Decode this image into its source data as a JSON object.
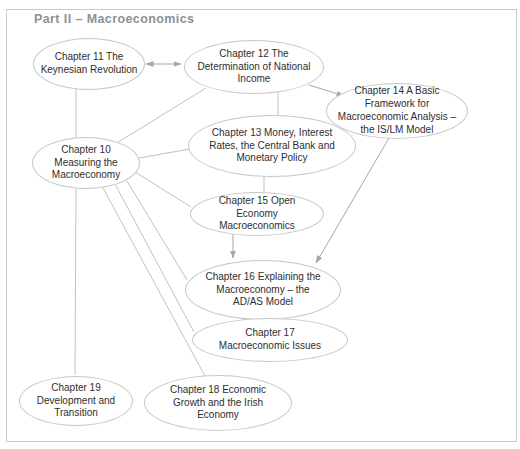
{
  "title": "Part II – Macroeconomics",
  "colors": {
    "frame": "#c9cbc9",
    "title": "#8e9193",
    "node_border": "#c5c9c6",
    "node_fill": "#ffffff",
    "text": "#2e2e2e",
    "line": "#bfc3bf",
    "arrow": "#a3a7a5"
  },
  "nodes": {
    "ch10": {
      "label": "Chapter 10 Measuring the Macroeconomy"
    },
    "ch11": {
      "label": "Chapter 11 The Keynesian Revolution"
    },
    "ch12": {
      "label": "Chapter 12 The Determination of National Income"
    },
    "ch13": {
      "label": "Chapter 13 Money, Interest Rates, the Central Bank and Monetary Policy"
    },
    "ch14": {
      "label": "Chapter 14 A Basic Framework for Macroeconomic Analysis – the IS/LM Model"
    },
    "ch15": {
      "label": "Chapter 15 Open Economy Macroeconomics"
    },
    "ch16": {
      "label": "Chapter 16 Explaining the Macroeconomy – the AD/AS Model"
    },
    "ch17": {
      "label": "Chapter 17 Macroeconomic Issues"
    },
    "ch18": {
      "label": "Chapter 18 Economic Growth and the Irish Economy"
    },
    "ch19": {
      "label": "Chapter 19 Development and Transition"
    }
  },
  "edges": [
    {
      "from": "ch11",
      "to": "ch12",
      "style": "double-arrow"
    },
    {
      "from": "ch12",
      "to": "ch14",
      "style": "arrow"
    },
    {
      "from": "ch13",
      "to": "ch14",
      "style": "arrow"
    },
    {
      "from": "ch15",
      "to": "ch16",
      "style": "arrow"
    },
    {
      "from": "ch14",
      "to": "ch16",
      "style": "arrow"
    },
    {
      "from": "ch11",
      "to": "ch10",
      "style": "line"
    },
    {
      "from": "ch12",
      "to": "ch10",
      "style": "line"
    },
    {
      "from": "ch12",
      "to": "ch13",
      "style": "line"
    },
    {
      "from": "ch13",
      "to": "ch15",
      "style": "line"
    },
    {
      "from": "ch10",
      "to": "ch13",
      "style": "line"
    },
    {
      "from": "ch10",
      "to": "ch15",
      "style": "line"
    },
    {
      "from": "ch10",
      "to": "ch16",
      "style": "line"
    },
    {
      "from": "ch10",
      "to": "ch17",
      "style": "line"
    },
    {
      "from": "ch10",
      "to": "ch18",
      "style": "line"
    },
    {
      "from": "ch10",
      "to": "ch19",
      "style": "line"
    }
  ]
}
